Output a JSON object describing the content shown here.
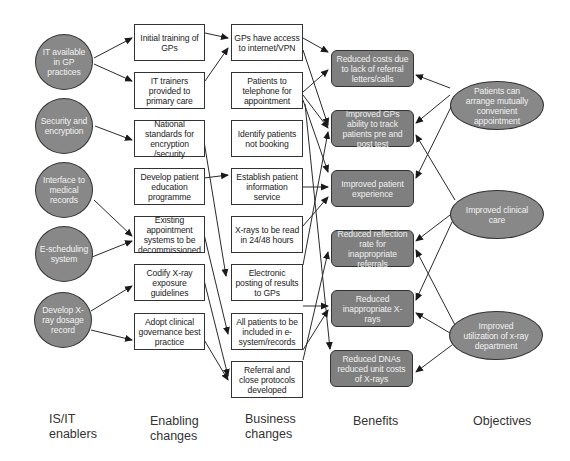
{
  "colors": {
    "ellipse_fill": "#888888",
    "benefit_fill": "#7f7f7f",
    "box_fill": "#ffffff",
    "stroke": "#333333"
  },
  "columns": {
    "enablers_label": [
      "IS/IT",
      "enablers"
    ],
    "enabling_label": [
      "Enabling",
      "changes"
    ],
    "business_label": [
      "Business",
      "changes"
    ],
    "benefits_label": [
      "Benefits"
    ],
    "objectives_label": [
      "Objectives"
    ]
  },
  "enablers": [
    {
      "id": "E1",
      "text": "IT available in GP practices"
    },
    {
      "id": "E2",
      "text": "Security and encryption"
    },
    {
      "id": "E3",
      "text": "Interface to medical records"
    },
    {
      "id": "E4",
      "text": "E-scheduling system"
    },
    {
      "id": "E5",
      "text": "Develop X-ray dosage record"
    }
  ],
  "enabling_changes": [
    {
      "id": "C1",
      "text": "Initial training of GPs"
    },
    {
      "id": "C2",
      "text": "IT trainers provided to primary care"
    },
    {
      "id": "C3",
      "text": "National standards for encryption /security"
    },
    {
      "id": "C4",
      "text": "Develop patient education programme"
    },
    {
      "id": "C5",
      "text": "Existing appointment systems to be decommissioned"
    },
    {
      "id": "C6",
      "text": "Codify X-ray exposure guidelines"
    },
    {
      "id": "C7",
      "text": "Adopt clinical governance best practice"
    }
  ],
  "business_changes": [
    {
      "id": "B1",
      "text": "GPs have access to internet/VPN"
    },
    {
      "id": "B2",
      "text": "Patients to telephone for appointment"
    },
    {
      "id": "B3",
      "text": "Identify patients not booking"
    },
    {
      "id": "B4",
      "text": "Establish patient information service"
    },
    {
      "id": "B5",
      "text": "X-rays to be read in 24/48 hours"
    },
    {
      "id": "B6",
      "text": "Electronic posting of results to GPs"
    },
    {
      "id": "B7",
      "text": "All patients to be included in e-system/records"
    },
    {
      "id": "B8",
      "text": "Referral and close protocols developed"
    }
  ],
  "benefits": [
    {
      "id": "N1",
      "text": "Reduced costs due to lack of referral letters/calls"
    },
    {
      "id": "N2",
      "text": "Improved GPs ability to track patients pre and post test"
    },
    {
      "id": "N3",
      "text": "Improved patient experience"
    },
    {
      "id": "N4",
      "text": "Reduced reflection rate for inappropriate referrals"
    },
    {
      "id": "N5",
      "text": "Reduced inappropriate X-rays"
    },
    {
      "id": "N6",
      "text": "Reduced DNAs reduced unit costs of X-rays"
    }
  ],
  "objectives": [
    {
      "id": "O1",
      "text": "Patients can arrange mutually convenient appointment"
    },
    {
      "id": "O2",
      "text": "Improved clinical care"
    },
    {
      "id": "O3",
      "text": "Improved utilization of x-ray department"
    }
  ],
  "edges": [
    [
      "E1",
      "C1"
    ],
    [
      "E1",
      "C2"
    ],
    [
      "E2",
      "C3"
    ],
    [
      "E3",
      "C5"
    ],
    [
      "E4",
      "C5"
    ],
    [
      "E5",
      "C6"
    ],
    [
      "E5",
      "C7"
    ],
    [
      "C1",
      "B1"
    ],
    [
      "C2",
      "B1"
    ],
    [
      "C4",
      "B4"
    ],
    [
      "C3",
      "B6"
    ],
    [
      "C5",
      "B7"
    ],
    [
      "C6",
      "B8"
    ],
    [
      "C7",
      "B8"
    ],
    [
      "B1",
      "N1"
    ],
    [
      "B1",
      "N2"
    ],
    [
      "B2",
      "N1"
    ],
    [
      "B2",
      "N2"
    ],
    [
      "B2",
      "N3"
    ],
    [
      "B2",
      "N6"
    ],
    [
      "B4",
      "N3"
    ],
    [
      "B5",
      "N3"
    ],
    [
      "B6",
      "N2"
    ],
    [
      "B7",
      "N5"
    ],
    [
      "B8",
      "N5"
    ],
    [
      "B8",
      "N4"
    ],
    [
      "O1",
      "N1"
    ],
    [
      "O1",
      "N2"
    ],
    [
      "O1",
      "N3"
    ],
    [
      "O2",
      "N2"
    ],
    [
      "O2",
      "N4"
    ],
    [
      "O2",
      "N5"
    ],
    [
      "O3",
      "N4"
    ],
    [
      "O3",
      "N5"
    ],
    [
      "O3",
      "N6"
    ]
  ]
}
